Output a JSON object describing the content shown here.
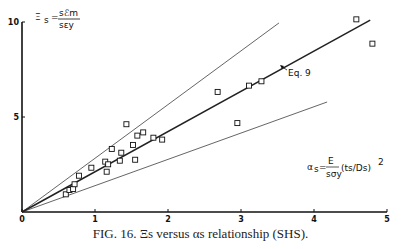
{
  "chart_data": {
    "type": "scatter",
    "title": "",
    "caption": "FIG. 16. Ξs versus αs relationship (SHS).",
    "xlabel": "αs = E/σy (ts/Ds)²",
    "ylabel": "Ξs = sℰm / sεy",
    "xlim": [
      0,
      5
    ],
    "ylim": [
      0,
      10
    ],
    "x_ticks": [
      "0",
      "1",
      "2",
      "3",
      "4",
      "5"
    ],
    "y_ticks": [
      "5",
      "10"
    ],
    "grid": false,
    "legend": null,
    "annotations": [
      "Eq. 9"
    ],
    "series": [
      {
        "name": "Test data",
        "marker": "open-square",
        "points": [
          [
            0.6,
            0.93
          ],
          [
            0.65,
            1.16
          ],
          [
            0.7,
            1.21
          ],
          [
            0.72,
            1.46
          ],
          [
            0.78,
            1.91
          ],
          [
            0.95,
            2.33
          ],
          [
            1.14,
            2.65
          ],
          [
            1.16,
            2.12
          ],
          [
            1.18,
            2.51
          ],
          [
            1.23,
            3.32
          ],
          [
            1.34,
            2.7
          ],
          [
            1.36,
            3.12
          ],
          [
            1.43,
            4.62
          ],
          [
            1.52,
            3.53
          ],
          [
            1.55,
            2.75
          ],
          [
            1.58,
            4.02
          ],
          [
            1.66,
            4.19
          ],
          [
            1.8,
            3.91
          ],
          [
            1.92,
            3.81
          ],
          [
            2.68,
            6.32
          ],
          [
            2.95,
            4.68
          ],
          [
            3.11,
            6.65
          ],
          [
            3.28,
            6.88
          ],
          [
            4.58,
            10.14
          ],
          [
            4.8,
            8.86
          ]
        ]
      },
      {
        "name": "Eq. 9",
        "type": "line",
        "points": [
          [
            0,
            0
          ],
          [
            4.77,
            10.1
          ]
        ],
        "style": "thick"
      },
      {
        "name": "Upper bound",
        "type": "line",
        "points": [
          [
            0,
            0
          ],
          [
            3.52,
            9.95
          ]
        ],
        "style": "thin"
      },
      {
        "name": "Lower bound",
        "type": "line",
        "points": [
          [
            0,
            0
          ],
          [
            4.18,
            5.79
          ]
        ],
        "style": "thin"
      }
    ]
  },
  "labels": {
    "y_eq_lhs": "Ξ",
    "y_eq_sub": "s",
    "y_eq_num": "sℰm",
    "y_eq_den": "sεy",
    "x_eq_lhs": "α",
    "x_eq_sub": "s",
    "x_eq_rhs_num": "E",
    "x_eq_rhs_den": "sσy",
    "x_eq_paren": "(ts/Ds)",
    "x_eq_pow": "2",
    "eq9": "Eq. 9"
  }
}
